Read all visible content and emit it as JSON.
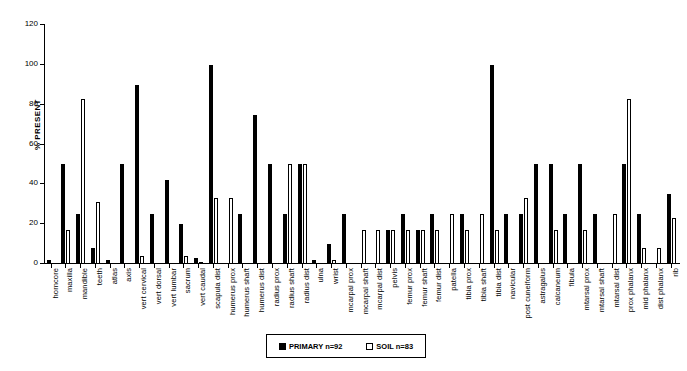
{
  "chart_data": {
    "type": "bar",
    "title": "",
    "xlabel": "",
    "ylabel": "% PRESENT",
    "ylim": [
      0,
      120
    ],
    "yticks": [
      0,
      20,
      40,
      60,
      80,
      100,
      120
    ],
    "grid": false,
    "legend_position": "bottom-center",
    "categories": [
      "horncore",
      "maxilla",
      "mandible",
      "teeth",
      "atlas",
      "axis",
      "vert cervical",
      "vert dorsal",
      "vert lumbar",
      "sacrum",
      "vert caudal",
      "scapula dist",
      "humerus prox",
      "humerus shaft",
      "humerus dist",
      "radius prox",
      "radius shaft",
      "radius dist",
      "ulna",
      "wrist",
      "mcarpal prox",
      "mcarpal shaft",
      "mcarpal dist",
      "pelvis",
      "femur prox",
      "femur shaft",
      "femur dist",
      "patella",
      "tibia prox",
      "tibia shaft",
      "tibia dist",
      "navicular",
      "post cuneiform",
      "astragalus",
      "calcaneum",
      "fibula",
      "mtarsal prox",
      "mtarsal shaft",
      "mtarsal dist",
      "prox phalanx",
      "mid phalanx",
      "dist phalanx",
      "rib"
    ],
    "series": [
      {
        "name": "PRIMARY n=92",
        "color": "#000000",
        "style": "filled",
        "values": [
          2,
          50,
          25,
          8,
          2,
          50,
          90,
          25,
          42,
          20,
          3,
          100,
          0,
          25,
          75,
          50,
          25,
          50,
          2,
          10,
          25,
          0,
          0,
          17,
          25,
          17,
          25,
          0,
          25,
          0,
          100,
          25,
          25,
          50,
          50,
          25,
          50,
          25,
          0,
          50,
          25,
          0,
          35
        ]
      },
      {
        "name": "SOIL n=83",
        "color": "#ffffff",
        "style": "hollow",
        "values": [
          0,
          17,
          83,
          31,
          0,
          0,
          4,
          0,
          0,
          4,
          1,
          33,
          33,
          0,
          0,
          0,
          50,
          50,
          0,
          2,
          0,
          17,
          17,
          17,
          17,
          17,
          17,
          25,
          17,
          25,
          17,
          0,
          33,
          0,
          17,
          0,
          17,
          0,
          25,
          83,
          8,
          8,
          23
        ]
      }
    ]
  },
  "legend": {
    "items": [
      {
        "label": "PRIMARY n=92",
        "swatch": "filled"
      },
      {
        "label": "SOIL n=83",
        "swatch": "hollow"
      }
    ]
  }
}
